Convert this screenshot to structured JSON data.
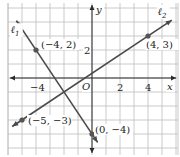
{
  "chart_data": {
    "type": "line",
    "title": "",
    "xlabel": "x",
    "ylabel": "y",
    "xlim": [
      -6,
      6
    ],
    "ylim": [
      -5.5,
      5.5
    ],
    "grid": true,
    "x_ticks": [
      {
        "value": -4,
        "label": "−4"
      },
      {
        "value": 2,
        "label": "2"
      },
      {
        "value": 4,
        "label": "4"
      }
    ],
    "y_ticks": [
      {
        "value": 2,
        "label": "2"
      }
    ],
    "origin_label": "O",
    "series": [
      {
        "name": "ℓ1",
        "label_main": "ℓ",
        "label_sub": "1",
        "points": [
          {
            "x": -4,
            "y": 2,
            "label": "(−4, 2)"
          },
          {
            "x": 0,
            "y": -4,
            "label": "(0, −4)"
          }
        ],
        "extent_x": [
          -5.4,
          0.4
        ]
      },
      {
        "name": "ℓ2",
        "label_main": "ℓ",
        "label_sub": "2",
        "points": [
          {
            "x": -5,
            "y": -3,
            "label": "(−5, −3)"
          },
          {
            "x": 4,
            "y": 3,
            "label": "(4, 3)"
          }
        ],
        "extent_x": [
          -5.7,
          5.7
        ]
      }
    ]
  }
}
